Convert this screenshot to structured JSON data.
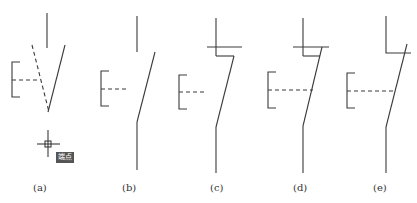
{
  "figure": {
    "panels": [
      {
        "id": "a",
        "label": "(a)",
        "description": "switch symbol with dashed operating link and cursor snap marker"
      },
      {
        "id": "b",
        "label": "(b)",
        "description": "normally-open switch contact"
      },
      {
        "id": "c",
        "label": "(c)",
        "description": "switch contact with top horizontal bar and step"
      },
      {
        "id": "d",
        "label": "(d)",
        "description": "switch contact with bar, step and extended dashed link"
      },
      {
        "id": "e",
        "label": "(e)",
        "description": "switch contact with L-shaped top and extended dashed link"
      }
    ],
    "snap_tag": "端点"
  }
}
